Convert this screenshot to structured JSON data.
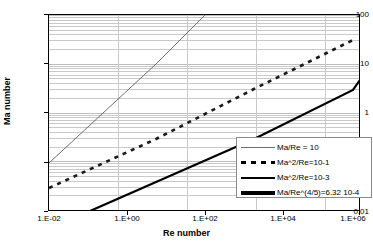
{
  "chart_data": {
    "type": "line",
    "title": "",
    "xlabel": "Re number",
    "ylabel": "Ma number",
    "xscale": "log",
    "yscale": "log",
    "xlim": [
      0.01,
      10000000
    ],
    "ylim": [
      0.01,
      100
    ],
    "grid": true,
    "legend_position": "bottom-right",
    "xticks": [
      "1.E-02",
      "1.E+00",
      "1.E+02",
      "1.E+04",
      "1.E+06"
    ],
    "xtick_values": [
      0.01,
      1,
      100,
      10000,
      1000000
    ],
    "yticks": [
      "0.01",
      "0.1",
      "1",
      "10",
      "100"
    ],
    "ytick_values": [
      0.01,
      0.1,
      1,
      10,
      100
    ],
    "series": [
      {
        "name": "Ma/Re = 10",
        "style": "thin-solid",
        "color": "#6e6e6e",
        "relation": "Ma = 10 * Re",
        "points": [
          [
            0.01,
            0.1
          ],
          [
            1.0,
            10.0
          ],
          [
            10.0,
            100.0
          ]
        ]
      },
      {
        "name": "Ma^2/Re=10-1",
        "style": "dashed",
        "color": "#000000",
        "relation": "Ma^2 / Re = 0.1",
        "points": [
          [
            0.01,
            0.0316
          ],
          [
            1.0,
            0.316
          ],
          [
            100.0,
            3.16
          ],
          [
            10000.0,
            31.6
          ],
          [
            50000.0,
            70.7
          ]
        ]
      },
      {
        "name": "Ma^2/Re=10-3",
        "style": "medium-solid",
        "color": "#000000",
        "relation": "Ma^2 / Re = 0.001",
        "points": [
          [
            0.1,
            0.01
          ],
          [
            100.0,
            0.316
          ],
          [
            10000.0,
            3.16
          ],
          [
            300000.0,
            17.3
          ]
        ]
      },
      {
        "name": "Ma/Re^(4/5)=6.32 10-4",
        "style": "thick-solid",
        "color": "#000000",
        "relation": "Ma / Re^(4/5) = 6.32e-4",
        "points": [
          [
            300000.0,
            17.3
          ],
          [
            1000000.0,
            40.0
          ],
          [
            2500000.0,
            90.0
          ]
        ]
      }
    ],
    "legend_entries": [
      {
        "label": "Ma/Re = 10",
        "style": "thin-solid"
      },
      {
        "label": "Ma^2/Re=10-1",
        "style": "dashed"
      },
      {
        "label": "Ma^2/Re=10-3",
        "style": "medium-solid"
      },
      {
        "label": "Ma/Re^(4/5)=6.32 10-4",
        "style": "thick-solid"
      }
    ]
  }
}
